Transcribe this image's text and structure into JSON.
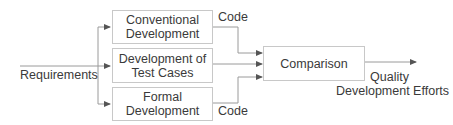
{
  "diagram": {
    "input": {
      "label": "Requirements"
    },
    "processes": [
      {
        "line1": "Conventional",
        "line2": "Development",
        "output_label": "Code"
      },
      {
        "line1": "Development of",
        "line2": "Test Cases"
      },
      {
        "line1": "Formal",
        "line2": "Development",
        "output_label": "Code"
      }
    ],
    "comparison": {
      "label": "Comparison"
    },
    "output": {
      "line1": "Quality",
      "line2": "Development Efforts"
    }
  },
  "colors": {
    "line": "#8a8a8a",
    "box_border": "#c8c8c8",
    "text": "#3a3a3a"
  }
}
